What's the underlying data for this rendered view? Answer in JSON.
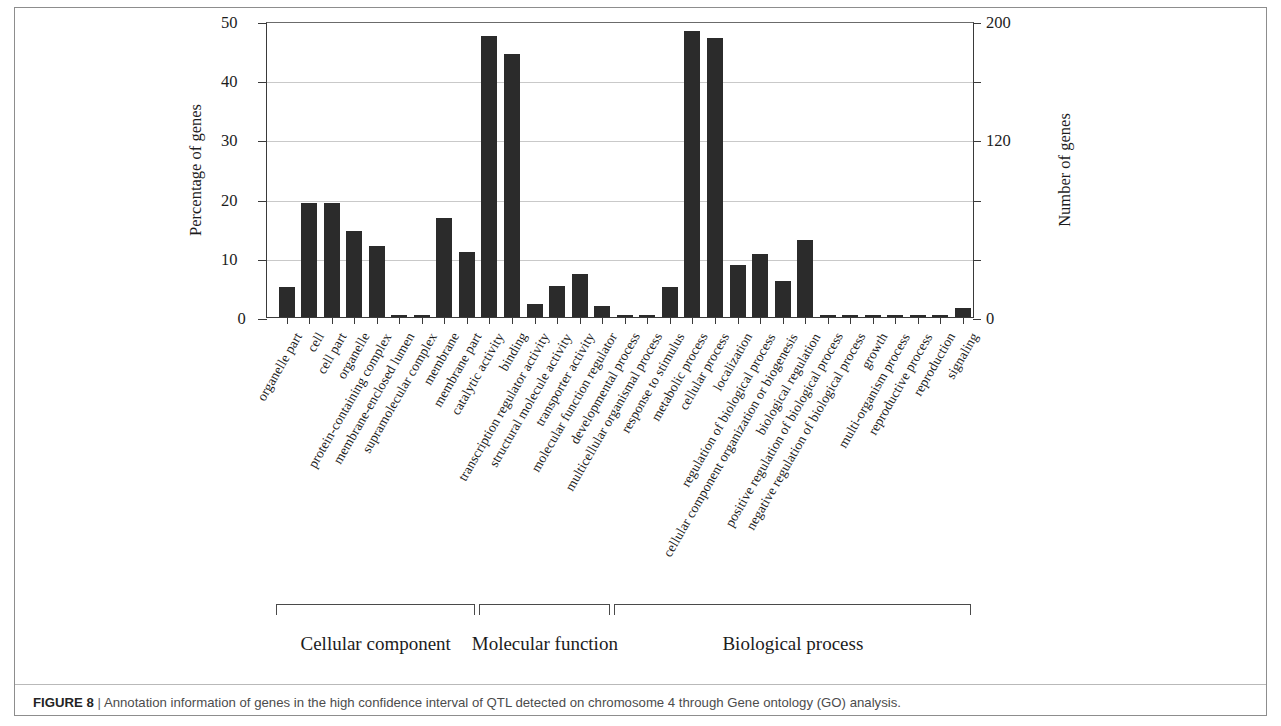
{
  "figure": {
    "label": "FIGURE 8",
    "separator": "|",
    "caption": "Annotation information of genes in the high confidence interval of QTL detected on chromosome 4 through Gene ontology (GO) analysis."
  },
  "chart_data": {
    "type": "bar",
    "title": "",
    "xlabel": "",
    "ylabel": "Percentage of genes",
    "y2label": "Number of genes",
    "ylim": [
      0,
      50
    ],
    "y2lim": [
      0,
      200
    ],
    "yticks": [
      0,
      10,
      20,
      30,
      40,
      50
    ],
    "yticklabels": [
      "0",
      "10",
      "20",
      "30",
      "40",
      "50"
    ],
    "y2ticks": [
      0,
      40,
      80,
      120,
      160,
      200
    ],
    "y2ticklabels": [
      "0",
      "",
      "",
      "120",
      "",
      "200"
    ],
    "grid": true,
    "legend": "none",
    "bar_color": "#2b2b2b",
    "categories": [
      "organelle part",
      "cell",
      "cell part",
      "organelle",
      "protein-containing complex",
      "membrane-enclosed lumen",
      "supramolecular complex",
      "membrane",
      "membrane part",
      "catalytic activity",
      "binding",
      "transcription regulator activity",
      "structural molecule activity",
      "transporter activity",
      "molecular function regulator",
      "developmental process",
      "multicellular organismal process",
      "response to stimulus",
      "metabolic process",
      "cellular process",
      "localization",
      "regulation of biological process",
      "cellular component organization or biogenesis",
      "biological regulation",
      "positive regulation of biological process",
      "negative regulation of biological process",
      "growth",
      "multi-organism process",
      "reproductive process",
      "reproduction",
      "signaling"
    ],
    "values": [
      5.0,
      19.2,
      19.2,
      14.5,
      12.0,
      0.3,
      0.1,
      16.7,
      11.0,
      47.5,
      44.5,
      2.2,
      5.3,
      7.3,
      1.8,
      0.3,
      0.4,
      5.0,
      48.3,
      47.2,
      8.8,
      10.6,
      6.1,
      13.0,
      0.4,
      0.2,
      0.4,
      0.1,
      0.1,
      0.1,
      1.6
    ],
    "groups": [
      {
        "label": "Cellular component",
        "start_index": 0,
        "end_index": 8
      },
      {
        "label": "Molecular function",
        "start_index": 9,
        "end_index": 14
      },
      {
        "label": "Biological process",
        "start_index": 15,
        "end_index": 30
      }
    ]
  }
}
